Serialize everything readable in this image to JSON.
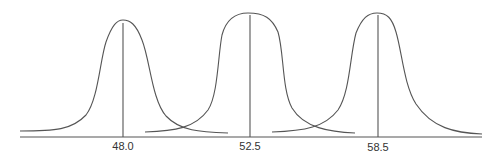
{
  "diagram": {
    "axis": {
      "x_start": 20,
      "x_end": 482,
      "y": 137
    },
    "colors": {
      "stroke": "#555555",
      "text": "#333333",
      "background": "#ffffff"
    },
    "curves": [
      {
        "label": "48.0",
        "center_x": 123,
        "peak_y": 20,
        "start_x": 20,
        "end_x": 228,
        "tail_y": 131,
        "path": "M20,131 C55,131 72,130 86,115 C98,100 100,60 106,42 C112,25 117,20 123,20 C130,20 136,24 142,40 C150,60 152,100 166,116 C180,131 200,132 228,133"
      },
      {
        "label": "52.5",
        "center_x": 250,
        "peak_y": 13,
        "start_x": 145,
        "end_x": 355,
        "tail_y": 131,
        "path": "M145,132 C175,131 195,128 208,110 C218,95 218,55 222,35 C226,20 234,13 248,13 C264,13 272,18 278,32 C284,52 282,90 292,108 C304,128 330,132 355,133"
      },
      {
        "label": "58.5",
        "center_x": 378,
        "peak_y": 13,
        "start_x": 272,
        "end_x": 482,
        "tail_y": 132,
        "path": "M272,132 C305,131 325,127 338,110 C350,92 350,55 356,33 C362,18 368,13 377,13 C387,13 392,18 396,32 C402,52 404,85 416,104 C432,128 455,133 482,134"
      }
    ]
  }
}
